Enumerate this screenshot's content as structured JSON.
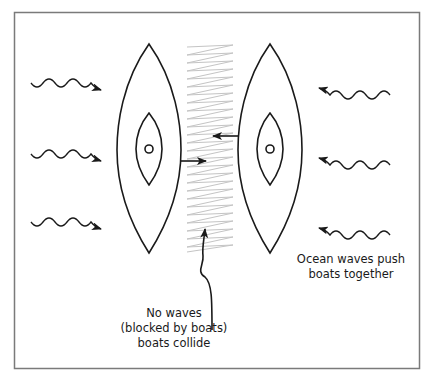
{
  "diagram": {
    "colors": {
      "stroke": "#1a1a1a",
      "zigzag": "#c4c4c4",
      "border": "#7a7a7a",
      "background": "#ffffff"
    },
    "labels": {
      "center_line1": "No waves",
      "center_line2": "(blocked by boats)",
      "center_line3": "boats collide",
      "right_line1": "Ocean waves push",
      "right_line2": "boats together"
    },
    "elements": {
      "boats": [
        "left-boat",
        "right-boat"
      ],
      "left_waves": 3,
      "right_waves": 3,
      "push_arrows": [
        "left-boat-right-arrow",
        "right-boat-left-arrow"
      ],
      "pointer_arrow": "curvy-arrow-to-calm-zone"
    }
  }
}
